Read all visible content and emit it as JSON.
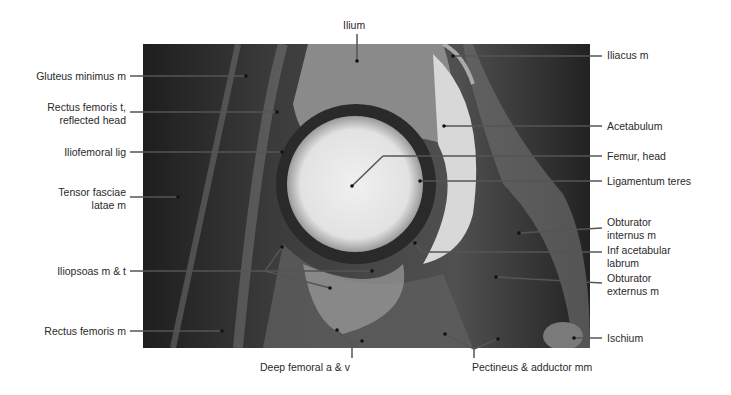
{
  "figure": {
    "type": "labeled MRI, hip coronal section",
    "labels_left": [
      {
        "id": "gluteus-minimus",
        "text": "Gluteus minimus m"
      },
      {
        "id": "rectus-femoris-tendon",
        "text": "Rectus femoris t,\nreflected head"
      },
      {
        "id": "iliofemoral-lig",
        "text": "Iliofemoral lig"
      },
      {
        "id": "tensor-fasciae-latae",
        "text": "Tensor fasciae\nlatae m"
      },
      {
        "id": "iliopsoas",
        "text": "Iliopsoas m & t"
      },
      {
        "id": "rectus-femoris-m",
        "text": "Rectus femoris m"
      }
    ],
    "labels_top": [
      {
        "id": "ilium",
        "text": "Ilium"
      }
    ],
    "labels_right": [
      {
        "id": "iliacus",
        "text": "Iliacus m"
      },
      {
        "id": "acetabulum",
        "text": "Acetabulum"
      },
      {
        "id": "femur-head",
        "text": "Femur, head"
      },
      {
        "id": "ligamentum-teres",
        "text": "Ligamentum teres"
      },
      {
        "id": "obturator-internus",
        "text": "Obturator\ninternus m"
      },
      {
        "id": "inf-acetabular-labrum",
        "text": "Inf acetabular\nlabrum"
      },
      {
        "id": "obturator-externus",
        "text": "Obturator\nexternus m"
      },
      {
        "id": "ischium",
        "text": "Ischium"
      }
    ],
    "labels_bottom": [
      {
        "id": "deep-femoral",
        "text": "Deep femoral a & v"
      },
      {
        "id": "pectineus-adductor",
        "text": "Pectineus & adductor mm"
      }
    ]
  }
}
